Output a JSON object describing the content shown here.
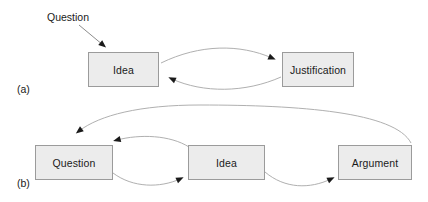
{
  "figure": {
    "width": 428,
    "height": 202,
    "background_color": "#ffffff",
    "box_fill_color": "#ececec",
    "box_border_color": "#9b9b9b",
    "connector_color": "#8c8c8c",
    "arrowhead_color": "#1a1a1a",
    "text_color": "#1a1a1a"
  },
  "panel_a": {
    "label": "(a)",
    "free_labels": [
      {
        "name": "question",
        "text": "Question"
      }
    ],
    "nodes": [
      {
        "id": "idea",
        "label": "Idea"
      },
      {
        "id": "justification",
        "label": "Justification"
      }
    ],
    "connectors": [
      {
        "from": "Question",
        "to": "Idea",
        "style": "straight-arrow"
      },
      {
        "from": "Idea",
        "to": "Justification",
        "style": "curved-arrow-upper"
      },
      {
        "from": "Justification",
        "to": "Idea",
        "style": "curved-arrow-lower"
      }
    ]
  },
  "panel_b": {
    "label": "(b)",
    "nodes": [
      {
        "id": "question",
        "label": "Question"
      },
      {
        "id": "idea",
        "label": "Idea"
      },
      {
        "id": "argument",
        "label": "Argument"
      }
    ],
    "connectors": [
      {
        "from": "Question",
        "to": "Idea",
        "style": "curved-arrow-lower"
      },
      {
        "from": "Idea",
        "to": "Question",
        "style": "curved-arrow-upper"
      },
      {
        "from": "Idea",
        "to": "Argument",
        "style": "curved-arrow-lower"
      },
      {
        "from": "Argument",
        "to": "Question",
        "style": "long-arc-over-top"
      }
    ]
  }
}
